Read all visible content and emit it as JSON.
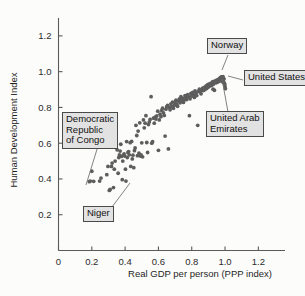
{
  "chart_data": {
    "type": "scatter",
    "title": "",
    "xlabel": "Real GDP per person (PPP index)",
    "ylabel": "Human Development Index",
    "xlim": [
      0,
      1.36
    ],
    "ylim": [
      0,
      1.3
    ],
    "xticks": [
      0,
      0.2,
      0.4,
      0.6,
      0.8,
      1.0,
      1.2
    ],
    "xtick_labels": [
      "0",
      "0.2",
      "0.4",
      "0.6",
      "0.8",
      "1.0",
      "1.2"
    ],
    "yticks": [
      0.2,
      0.4,
      0.6,
      0.8,
      1.0,
      1.2
    ],
    "ytick_labels": [
      "0.2",
      "0.4",
      "0.6",
      "0.8",
      "1.0",
      "1.2"
    ],
    "grid": false,
    "legend": "none",
    "point_color": "#5d5d5d",
    "point_radius": 1.9,
    "points": [
      [
        0.185,
        0.385
      ],
      [
        0.191,
        0.388
      ],
      [
        0.2,
        0.443
      ],
      [
        0.211,
        0.387
      ],
      [
        0.247,
        0.388
      ],
      [
        0.255,
        0.405
      ],
      [
        0.29,
        0.424
      ],
      [
        0.297,
        0.47
      ],
      [
        0.305,
        0.336
      ],
      [
        0.31,
        0.341
      ],
      [
        0.318,
        0.47
      ],
      [
        0.322,
        0.489
      ],
      [
        0.33,
        0.352
      ],
      [
        0.335,
        0.455
      ],
      [
        0.34,
        0.5
      ],
      [
        0.344,
        0.577
      ],
      [
        0.352,
        0.563
      ],
      [
        0.358,
        0.432
      ],
      [
        0.362,
        0.52
      ],
      [
        0.366,
        0.535
      ],
      [
        0.37,
        0.556
      ],
      [
        0.374,
        0.594
      ],
      [
        0.378,
        0.526
      ],
      [
        0.383,
        0.396
      ],
      [
        0.386,
        0.5
      ],
      [
        0.39,
        0.533
      ],
      [
        0.394,
        0.54
      ],
      [
        0.398,
        0.528
      ],
      [
        0.402,
        0.455
      ],
      [
        0.405,
        0.388
      ],
      [
        0.409,
        0.609
      ],
      [
        0.413,
        0.52
      ],
      [
        0.417,
        0.548
      ],
      [
        0.421,
        0.553
      ],
      [
        0.425,
        0.535
      ],
      [
        0.43,
        0.603
      ],
      [
        0.434,
        0.47
      ],
      [
        0.439,
        0.61
      ],
      [
        0.443,
        0.512
      ],
      [
        0.447,
        0.533
      ],
      [
        0.452,
        0.463
      ],
      [
        0.456,
        0.558
      ],
      [
        0.46,
        0.573
      ],
      [
        0.465,
        0.7
      ],
      [
        0.47,
        0.643
      ],
      [
        0.474,
        0.53
      ],
      [
        0.478,
        0.668
      ],
      [
        0.483,
        0.545
      ],
      [
        0.488,
        0.714
      ],
      [
        0.492,
        0.528
      ],
      [
        0.496,
        0.535
      ],
      [
        0.5,
        0.602
      ],
      [
        0.505,
        0.524
      ],
      [
        0.51,
        0.73
      ],
      [
        0.515,
        0.686
      ],
      [
        0.52,
        0.712
      ],
      [
        0.525,
        0.754
      ],
      [
        0.53,
        0.604
      ],
      [
        0.535,
        0.548
      ],
      [
        0.54,
        0.704
      ],
      [
        0.545,
        0.718
      ],
      [
        0.55,
        0.733
      ],
      [
        0.556,
        0.86
      ],
      [
        0.56,
        0.6
      ],
      [
        0.565,
        0.608
      ],
      [
        0.57,
        0.74
      ],
      [
        0.575,
        0.712
      ],
      [
        0.58,
        0.746
      ],
      [
        0.585,
        0.735
      ],
      [
        0.59,
        0.752
      ],
      [
        0.596,
        0.779
      ],
      [
        0.6,
        0.56
      ],
      [
        0.605,
        0.73
      ],
      [
        0.61,
        0.762
      ],
      [
        0.615,
        0.748
      ],
      [
        0.62,
        0.783
      ],
      [
        0.625,
        0.796
      ],
      [
        0.63,
        0.77
      ],
      [
        0.635,
        0.755
      ],
      [
        0.64,
        0.64
      ],
      [
        0.645,
        0.79
      ],
      [
        0.65,
        0.804
      ],
      [
        0.655,
        0.812
      ],
      [
        0.66,
        0.568
      ],
      [
        0.665,
        0.8
      ],
      [
        0.67,
        0.787
      ],
      [
        0.675,
        0.82
      ],
      [
        0.68,
        0.806
      ],
      [
        0.685,
        0.83
      ],
      [
        0.69,
        0.795
      ],
      [
        0.696,
        0.812
      ],
      [
        0.7,
        0.826
      ],
      [
        0.705,
        0.84
      ],
      [
        0.71,
        0.818
      ],
      [
        0.715,
        0.806
      ],
      [
        0.72,
        0.836
      ],
      [
        0.726,
        0.848
      ],
      [
        0.73,
        0.826
      ],
      [
        0.735,
        0.86
      ],
      [
        0.74,
        0.838
      ],
      [
        0.745,
        0.852
      ],
      [
        0.75,
        0.828
      ],
      [
        0.756,
        0.842
      ],
      [
        0.76,
        0.866
      ],
      [
        0.765,
        0.855
      ],
      [
        0.77,
        0.844
      ],
      [
        0.776,
        0.872
      ],
      [
        0.78,
        0.86
      ],
      [
        0.786,
        0.754
      ],
      [
        0.79,
        0.848
      ],
      [
        0.795,
        0.878
      ],
      [
        0.8,
        0.864
      ],
      [
        0.806,
        0.884
      ],
      [
        0.81,
        0.87
      ],
      [
        0.816,
        0.856
      ],
      [
        0.82,
        0.892
      ],
      [
        0.826,
        0.878
      ],
      [
        0.83,
        0.866
      ],
      [
        0.836,
        0.7
      ],
      [
        0.84,
        0.89
      ],
      [
        0.846,
        0.902
      ],
      [
        0.85,
        0.886
      ],
      [
        0.856,
        0.876
      ],
      [
        0.86,
        0.896
      ],
      [
        0.866,
        0.908
      ],
      [
        0.87,
        0.894
      ],
      [
        0.876,
        0.912
      ],
      [
        0.88,
        0.9
      ],
      [
        0.886,
        0.92
      ],
      [
        0.89,
        0.906
      ],
      [
        0.896,
        0.928
      ],
      [
        0.9,
        0.914
      ],
      [
        0.906,
        0.932
      ],
      [
        0.91,
        0.92
      ],
      [
        0.916,
        0.936
      ],
      [
        0.92,
        0.924
      ],
      [
        0.926,
        0.944
      ],
      [
        0.93,
        0.93
      ],
      [
        0.936,
        0.896
      ],
      [
        0.94,
        0.948
      ],
      [
        0.946,
        0.938
      ],
      [
        0.95,
        0.952
      ],
      [
        0.956,
        0.942
      ],
      [
        0.96,
        0.956
      ],
      [
        0.962,
        0.946
      ],
      [
        0.966,
        0.96
      ],
      [
        0.968,
        0.95
      ],
      [
        0.97,
        0.964
      ],
      [
        0.972,
        0.955
      ],
      [
        0.974,
        0.968
      ],
      [
        0.976,
        0.958
      ],
      [
        0.978,
        0.97
      ],
      [
        0.98,
        0.962
      ],
      [
        0.982,
        0.944
      ],
      [
        0.984,
        0.966
      ],
      [
        0.986,
        0.955
      ],
      [
        0.988,
        0.972
      ],
      [
        0.99,
        0.948
      ],
      [
        0.992,
        0.94
      ],
      [
        0.994,
        0.96
      ],
      [
        0.996,
        0.935
      ],
      [
        0.998,
        0.928
      ],
      [
        1.0,
        0.916
      ],
      [
        1.002,
        0.905
      ],
      [
        0.962,
        0.73
      ],
      [
        0.928,
        0.902
      ]
    ],
    "highlights": [
      {
        "name": "Norway",
        "x": 0.985,
        "y": 0.972
      },
      {
        "name": "United States",
        "x": 1.002,
        "y": 0.918
      },
      {
        "name": "United Arab Emirates",
        "x": 0.962,
        "y": 0.73
      },
      {
        "name": "Democratic Republic of Congo",
        "x": 0.186,
        "y": 0.386
      },
      {
        "name": "Niger",
        "x": 0.307,
        "y": 0.338
      }
    ]
  },
  "callouts": {
    "norway": "Norway",
    "united_states": "United States",
    "uae_line1": "United Arab",
    "uae_line2": "Emirates",
    "congo_line1": "Democratic",
    "congo_line2": "Republic",
    "congo_line3": "of Congo",
    "niger": "Niger"
  }
}
